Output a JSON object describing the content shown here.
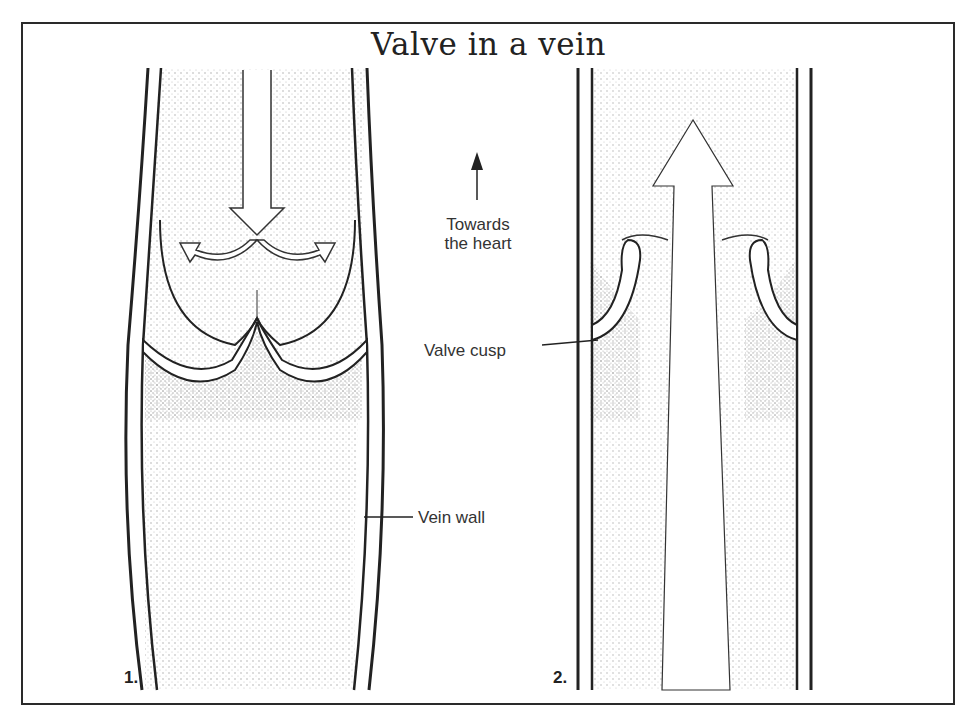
{
  "title": "Valve in a vein",
  "labels": {
    "direction_line1": "Towards",
    "direction_line2": "the heart",
    "valve_cusp": "Valve cusp",
    "vein_wall": "Vein wall"
  },
  "panels": [
    {
      "number": "1.",
      "state": "valve closed",
      "flow": "downward arrow splitting into cusps"
    },
    {
      "number": "2.",
      "state": "valve open",
      "flow": "upward arrow"
    }
  ],
  "colors": {
    "ink": "#222222",
    "background": "#ffffff",
    "stipple": "#555555"
  }
}
